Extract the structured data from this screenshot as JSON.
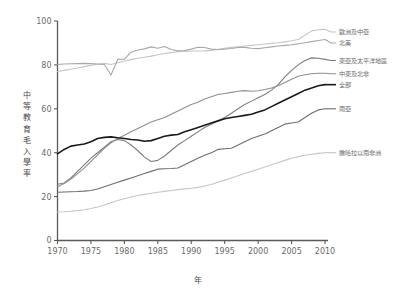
{
  "chart_data": {
    "type": "line",
    "title": "",
    "xlabel": "年",
    "ylabel": "中等教育毛入學率",
    "xlim": [
      1970,
      2010
    ],
    "ylim": [
      0,
      100
    ],
    "grid": false,
    "legend_position": "right-outside-at-line-end",
    "x_ticks": [
      "1970",
      "1975",
      "1980",
      "1985",
      "1990",
      "1995",
      "2000",
      "2005",
      "2010"
    ],
    "y_ticks": [
      "0",
      "20",
      "40",
      "60",
      "80",
      "100"
    ],
    "x": [
      1970,
      1971,
      1972,
      1973,
      1974,
      1975,
      1976,
      1977,
      1978,
      1979,
      1980,
      1981,
      1982,
      1983,
      1984,
      1985,
      1986,
      1987,
      1988,
      1989,
      1990,
      1991,
      1992,
      1993,
      1994,
      1995,
      1996,
      1997,
      1998,
      1999,
      2000,
      2001,
      2002,
      2003,
      2004,
      2005,
      2006,
      2007,
      2008,
      2009,
      2010
    ],
    "series": [
      {
        "name": "歐洲及中亞",
        "color": "#c6c6c6",
        "width": 1.1,
        "label_y": 95,
        "values": [
          77.0,
          77.5,
          78.0,
          78.6,
          79.2,
          79.8,
          80.3,
          80.7,
          80.2,
          81.0,
          81.8,
          82.4,
          83.0,
          83.5,
          84.0,
          84.6,
          85.2,
          85.6,
          86.0,
          86.1,
          86.3,
          86.3,
          86.4,
          86.6,
          87.0,
          87.6,
          88.0,
          88.3,
          88.6,
          88.9,
          89.2,
          89.5,
          89.8,
          90.1,
          90.5,
          91.0,
          91.6,
          93.5,
          95.5,
          96.0,
          96.2
        ]
      },
      {
        "name": "北美",
        "color": "#a8a8a8",
        "width": 1.1,
        "label_y": 90,
        "values": [
          80.2,
          80.4,
          80.5,
          80.6,
          80.7,
          80.6,
          80.4,
          80.2,
          75.4,
          82.5,
          82.6,
          85.8,
          86.8,
          87.3,
          88.2,
          87.6,
          88.4,
          87.0,
          86.4,
          86.5,
          87.2,
          88.0,
          87.9,
          87.2,
          87.0,
          87.2,
          87.5,
          87.9,
          88.0,
          87.6,
          87.4,
          87.8,
          88.2,
          88.6,
          88.9,
          89.2,
          89.6,
          90.1,
          90.6,
          91.1,
          91.6
        ]
      },
      {
        "name": "東亞及太平洋地區",
        "color": "#7d7d7d",
        "width": 1.1,
        "label_y": 82,
        "values": [
          25.6,
          26.2,
          28.5,
          31.5,
          34.5,
          37.5,
          40.0,
          42.5,
          45.0,
          46.0,
          45.5,
          43.5,
          41.0,
          38.0,
          36.0,
          36.5,
          38.5,
          41.0,
          43.5,
          45.5,
          47.5,
          49.5,
          51.5,
          53.0,
          54.5,
          56.0,
          58.0,
          60.0,
          62.0,
          63.5,
          65.0,
          66.5,
          68.5,
          71.0,
          74.5,
          77.5,
          80.0,
          82.0,
          83.2,
          83.0,
          82.5
        ]
      },
      {
        "name": "中東及北非",
        "color": "#8f8f8f",
        "width": 1.1,
        "label_y": 76,
        "values": [
          24.5,
          26.0,
          28.0,
          30.5,
          33.0,
          36.0,
          39.0,
          42.0,
          44.5,
          46.5,
          48.0,
          49.5,
          51.0,
          52.5,
          54.0,
          55.0,
          56.0,
          57.5,
          59.0,
          60.5,
          62.0,
          63.0,
          64.5,
          65.5,
          66.5,
          67.0,
          67.5,
          68.0,
          68.3,
          68.0,
          68.2,
          68.8,
          69.5,
          70.5,
          72.0,
          73.5,
          74.8,
          75.5,
          76.0,
          76.2,
          76.2
        ]
      },
      {
        "name": "全部",
        "color": "#1a1a1a",
        "width": 1.6,
        "label_y": 71,
        "values": [
          39.5,
          41.5,
          43.0,
          43.5,
          44.0,
          45.0,
          46.5,
          47.0,
          47.2,
          46.8,
          46.5,
          46.0,
          45.8,
          45.2,
          45.5,
          46.5,
          47.5,
          48.0,
          48.3,
          49.5,
          50.5,
          51.5,
          52.5,
          53.5,
          54.5,
          55.5,
          56.0,
          56.5,
          57.0,
          57.5,
          58.5,
          59.5,
          61.0,
          62.5,
          64.0,
          65.5,
          67.0,
          68.5,
          69.5,
          70.5,
          71.0
        ]
      },
      {
        "name": "南亞",
        "color": "#6e6e6e",
        "width": 1.1,
        "label_y": 60,
        "values": [
          22.0,
          22.1,
          22.2,
          22.3,
          22.5,
          22.8,
          23.5,
          24.5,
          25.5,
          26.5,
          27.5,
          28.5,
          29.5,
          30.5,
          31.5,
          32.5,
          32.7,
          32.8,
          33.0,
          34.5,
          36.0,
          37.5,
          38.8,
          40.0,
          41.5,
          41.8,
          42.0,
          43.5,
          45.0,
          46.5,
          47.5,
          48.5,
          50.0,
          51.5,
          53.0,
          53.5,
          54.0,
          56.0,
          58.0,
          59.5,
          60.0
        ]
      },
      {
        "name": "撒哈拉以南非洲",
        "color": "#c6c6c6",
        "width": 1.1,
        "label_y": 40,
        "values": [
          13.0,
          13.1,
          13.3,
          13.6,
          14.0,
          14.6,
          15.3,
          16.2,
          17.2,
          18.2,
          19.0,
          19.8,
          20.5,
          21.0,
          21.5,
          22.0,
          22.4,
          22.8,
          23.2,
          23.5,
          23.8,
          24.2,
          24.8,
          25.5,
          26.5,
          27.5,
          28.5,
          29.5,
          30.5,
          31.5,
          32.5,
          33.5,
          34.5,
          35.5,
          36.5,
          37.5,
          38.2,
          38.8,
          39.3,
          39.7,
          40.0
        ]
      }
    ]
  },
  "axis": {
    "y_label": "中等教育毛入學率",
    "x_label": "年"
  },
  "top_caption": ""
}
